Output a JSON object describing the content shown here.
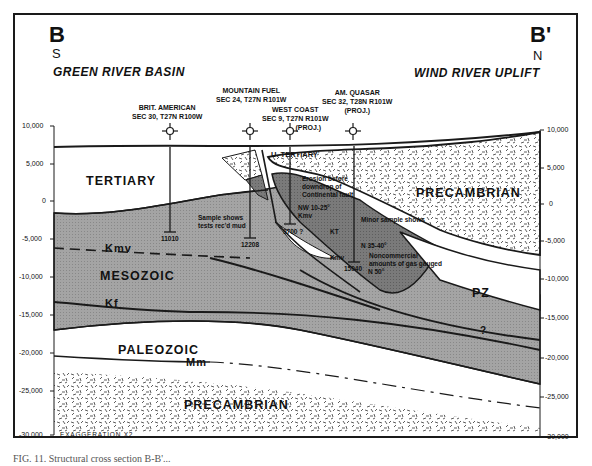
{
  "section": {
    "left_label": "B",
    "right_label": "B'",
    "left_direction": "S",
    "right_direction": "N",
    "left_region": "GREEN RIVER BASIN",
    "right_region": "WIND RIVER UPLIFT"
  },
  "wells": [
    {
      "name": "BRIT. AMERICAN",
      "location": "SEC 30, T27N R100W",
      "note": "",
      "td": "11010"
    },
    {
      "name": "MOUNTAIN FUEL",
      "location": "SEC 24, T27N R101W",
      "note": "",
      "td": "12208"
    },
    {
      "name": "WEST COAST",
      "location": "SEC 9, T27N R101W",
      "note": "(PROJ.)",
      "td": "9700 ?"
    },
    {
      "name": "AM. QUASAR",
      "location": "SEC 32, T28N R101W",
      "note": "(PROJ.)",
      "td": "15040"
    }
  ],
  "depth_axis": {
    "left_ticks": [
      "10,000",
      "5,000",
      "0",
      "-5,000",
      "-10,000",
      "-15,000",
      "-20,000",
      "-25,000",
      "-30,000"
    ],
    "right_ticks": [
      "10,000",
      "5,000",
      "0",
      "-5,000",
      "-10,000",
      "-15,000",
      "-20,000",
      "-25,000",
      "-30,000"
    ]
  },
  "units": {
    "tertiary": "TERTIARY",
    "u_tertiary": "U. TERTIARY",
    "mesozoic": "MESOZOIC",
    "paleozoic": "PALEOZOIC",
    "precambrian_lower": "PRECAMBRIAN",
    "precambrian_upper": "PRECAMBRIAN",
    "pz": "PZ"
  },
  "horizons": {
    "kmv": "Kmv",
    "kf": "Kf",
    "mm": "Mm",
    "kmv_small": "Kmv",
    "kmv_small2": "Kmv",
    "query": "?"
  },
  "annotations": {
    "sample_shows": "Sample shows",
    "tests_reached": "tests rec'd mud",
    "erosion_1": "Erosion before",
    "erosion_2": "downdrop of",
    "erosion_3": "Continental fault",
    "minor_shows": "Minor sample shows",
    "dip_1": "NW 10-25°",
    "kt": "KT",
    "dip_2": "N 35-40°",
    "dip_3": "N 50°",
    "nonc_1": "Noncommercial",
    "nonc_2": "amounts of gas gauged",
    "exaggeration": "EXAGGERATION X2"
  },
  "caption": "FIG. 11. Structural cross section B-B'...",
  "colors": {
    "mesozoic_fill": "#9a9a9a",
    "dark_fill": "#6e6e6e",
    "line": "#1a1a1a",
    "paper": "#ffffff"
  }
}
